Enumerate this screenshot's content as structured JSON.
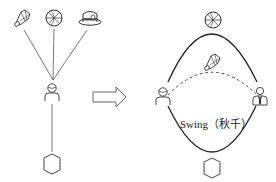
{
  "diagram": {
    "colors": {
      "stroke": "#3a3a3a",
      "background": "#ffffff"
    },
    "left_panel": {
      "top_icons": [
        {
          "name": "shuttlecock-icon",
          "x": 22,
          "y": 18
        },
        {
          "name": "basketball-icon",
          "x": 54,
          "y": 18
        },
        {
          "name": "hat-icon",
          "x": 90,
          "y": 18
        }
      ],
      "center_person": {
        "name": "person-icon",
        "x": 52,
        "y": 93
      },
      "bottom_icon": {
        "name": "books-icon",
        "x": 52,
        "y": 162
      }
    },
    "transition_arrow": {
      "name": "right-arrow-icon",
      "direction": "right"
    },
    "right_panel": {
      "top_icon": {
        "name": "basketball-icon",
        "x": 213,
        "y": 18
      },
      "middle_icon": {
        "name": "shuttlecock-icon",
        "x": 212,
        "y": 62
      },
      "left_person": {
        "name": "person-icon",
        "x": 163,
        "y": 97
      },
      "right_person": {
        "name": "businessman-icon",
        "x": 260,
        "y": 96
      },
      "bottom_icon": {
        "name": "books-icon",
        "x": 212,
        "y": 167
      },
      "swing_label": "Swing（秋千）"
    }
  }
}
